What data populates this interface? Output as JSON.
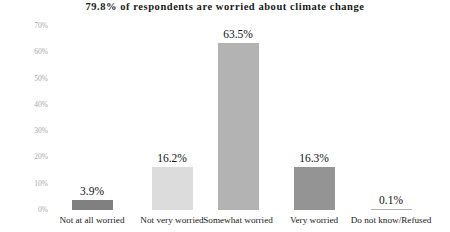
{
  "chart_data": {
    "type": "bar",
    "title": "79.8% of respondents are worried about climate change",
    "xlabel": "",
    "ylabel": "",
    "ylim": [
      0,
      70
    ],
    "grid": false,
    "legend": "none",
    "categories": [
      "Not at all worried",
      "Not very worried",
      "Somewhat worried",
      "Very worried",
      "Do not know/Refused"
    ],
    "values": [
      3.9,
      16.2,
      63.5,
      16.3,
      0.1
    ],
    "value_labels": [
      "3.9%",
      "16.2%",
      "63.5%",
      "16.3%",
      "0.1%"
    ],
    "bar_colors": [
      "#808080",
      "#dcdcdc",
      "#b3b3b3",
      "#949494",
      "#b0b0b0"
    ],
    "y_ticks": [
      0,
      10,
      20,
      30,
      40,
      50,
      60,
      70
    ],
    "y_tick_labels": [
      "0%",
      "10%",
      "20%",
      "30%",
      "40%",
      "50%",
      "60%",
      "70%"
    ],
    "axis_label_color": "#a8a8a8",
    "text_color": "#111111",
    "background": "#ffffff"
  }
}
